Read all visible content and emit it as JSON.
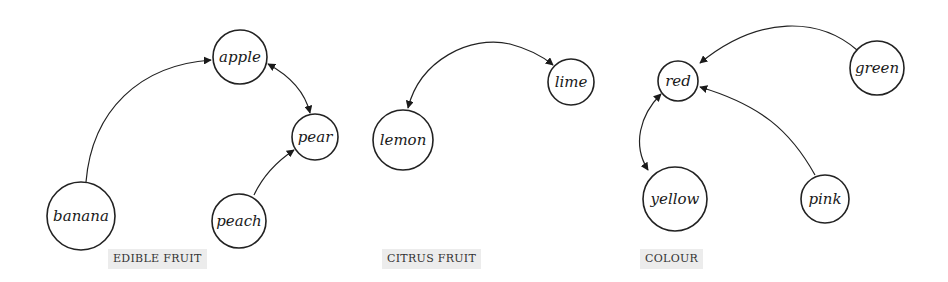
{
  "groups": [
    {
      "label": "EDIBLE FRUIT",
      "nodes": [
        {
          "id": "apple",
          "label": "apple"
        },
        {
          "id": "pear",
          "label": "pear"
        },
        {
          "id": "banana",
          "label": "banana"
        },
        {
          "id": "peach",
          "label": "peach"
        }
      ],
      "edges": [
        {
          "from": "banana",
          "to": "apple",
          "direction": "forward"
        },
        {
          "from": "apple",
          "to": "pear",
          "direction": "both"
        },
        {
          "from": "peach",
          "to": "pear",
          "direction": "forward"
        }
      ]
    },
    {
      "label": "CITRUS FRUIT",
      "nodes": [
        {
          "id": "lime",
          "label": "lime"
        },
        {
          "id": "lemon",
          "label": "lemon"
        }
      ],
      "edges": [
        {
          "from": "lemon",
          "to": "lime",
          "direction": "both"
        }
      ]
    },
    {
      "label": "COLOUR",
      "nodes": [
        {
          "id": "red",
          "label": "red"
        },
        {
          "id": "green",
          "label": "green"
        },
        {
          "id": "yellow",
          "label": "yellow"
        },
        {
          "id": "pink",
          "label": "pink"
        }
      ],
      "edges": [
        {
          "from": "green",
          "to": "red",
          "direction": "forward"
        },
        {
          "from": "pink",
          "to": "red",
          "direction": "forward"
        },
        {
          "from": "red",
          "to": "yellow",
          "direction": "both"
        }
      ]
    }
  ]
}
